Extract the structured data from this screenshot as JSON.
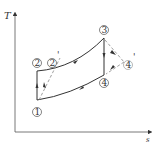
{
  "diagram": {
    "type": "T-s diagram",
    "axes": {
      "y_label": "T",
      "x_label": "s"
    },
    "points": [
      {
        "id": "1",
        "label": "①"
      },
      {
        "id": "2",
        "label": "②"
      },
      {
        "id": "2p",
        "label": "②'"
      },
      {
        "id": "3",
        "label": "③"
      },
      {
        "id": "4",
        "label": "④"
      },
      {
        "id": "4p",
        "label": "④'"
      }
    ],
    "processes": [
      {
        "from": "1",
        "to": "2",
        "style": "solid"
      },
      {
        "from": "1",
        "to": "2p",
        "style": "dashed"
      },
      {
        "from": "2",
        "to": "3",
        "style": "solid"
      },
      {
        "from": "3",
        "to": "4",
        "style": "solid"
      },
      {
        "from": "3",
        "to": "4p",
        "style": "dashed"
      },
      {
        "from": "4",
        "to": "1",
        "style": "solid"
      }
    ],
    "colors": {
      "line": "#333333",
      "dashed": "#888888"
    }
  }
}
